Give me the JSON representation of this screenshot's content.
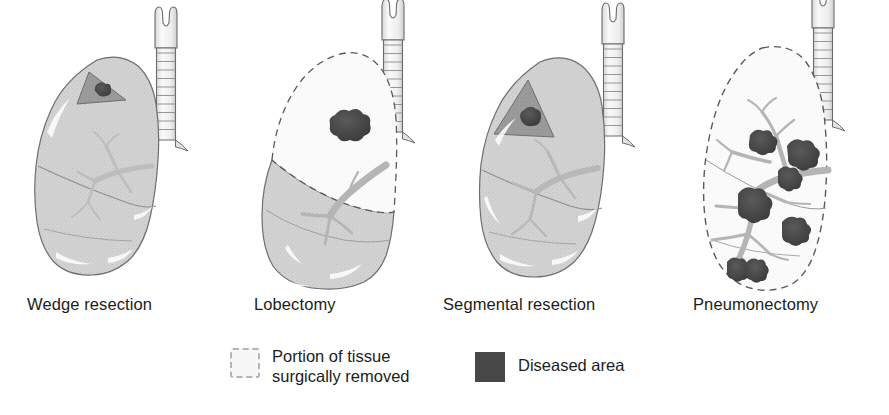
{
  "figure": {
    "background_color": "#ffffff",
    "panels": [
      {
        "id": "wedge",
        "label": "Wedge resection",
        "description": "Intact lung with a small wedge-shaped portion containing a tumor marked for removal",
        "removed_portion": "small wedge at apex",
        "diseased_masses": 1,
        "lung_state": "mostly intact"
      },
      {
        "id": "lobectomy",
        "label": "Lobectomy",
        "description": "Upper lobe outlined with dashes and shown white, indicating the whole lobe is removed; a tumor mass sits inside it",
        "removed_portion": "entire upper lobe",
        "diseased_masses": 1,
        "lung_state": "upper lobe removed"
      },
      {
        "id": "segmental",
        "label": "Segmental resection",
        "description": "A single bronchopulmonary segment shaded darker, containing a tumor, marked for removal",
        "removed_portion": "one segment of the upper lobe",
        "diseased_masses": 1,
        "lung_state": "mostly intact"
      },
      {
        "id": "pneumonectomy",
        "label": "Pneumonectomy",
        "description": "The entire lung outlined with dashes and shown white, indicating the whole lung is removed; multiple tumor masses along the bronchial tree",
        "removed_portion": "entire lung",
        "diseased_masses": 6,
        "lung_state": "whole lung removed"
      }
    ]
  },
  "legend": {
    "items": [
      {
        "id": "removed",
        "line1": "Portion of tissue",
        "line2": "surgically removed",
        "swatch": "dashed-outline-square",
        "swatch_border_color": "#b4b4b4",
        "swatch_fill_color": "#f7f7f7"
      },
      {
        "id": "diseased",
        "label": "Diseased area",
        "swatch": "filled-square",
        "swatch_fill_color": "#474747"
      }
    ]
  },
  "colors": {
    "lung_fill": "#d2d2d2",
    "lung_outline": "#6e6e6e",
    "removed_fill": "#fbfbfb",
    "dashed_outline": "#5a5a5a",
    "tumor": "#4a4a4a",
    "tumor_dark": "#3d3d3d",
    "bronchus": "#b5b5b5",
    "trachea_fill": "#ededed",
    "trachea_outline": "#6b6b6b",
    "segment_fill": "#9a9a9a",
    "highlight": "#ffffff",
    "text": "#1c1c1c"
  }
}
